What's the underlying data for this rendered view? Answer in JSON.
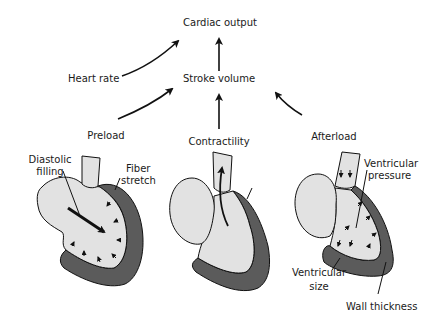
{
  "diagram": {
    "title": "Cardiac output",
    "nodes": {
      "cardiac_output": "Cardiac output",
      "heart_rate": "Heart rate",
      "stroke_volume": "Stroke volume",
      "preload": "Preload",
      "contractility": "Contractility",
      "afterload": "Afterload"
    },
    "edges": [
      {
        "from": "Heart rate",
        "to": "Cardiac output"
      },
      {
        "from": "Stroke volume",
        "to": "Cardiac output"
      },
      {
        "from": "Preload",
        "to": "Stroke volume"
      },
      {
        "from": "Contractility",
        "to": "Stroke volume"
      },
      {
        "from": "Afterload",
        "to": "Stroke volume"
      }
    ],
    "annotations": {
      "diastolic_filling_1": "Diastolic",
      "diastolic_filling_2": "filling",
      "fiber_stretch_1": "Fiber",
      "fiber_stretch_2": "stretch",
      "ventricular_pressure_1": "Ventricular",
      "ventricular_pressure_2": "pressure",
      "ventricular_size_1": "Ventricular",
      "ventricular_size_2": "size",
      "wall_thickness": "Wall thickness"
    },
    "colors": {
      "chamber_fill": "#e2e2e2",
      "wall_fill": "#5b5b5b",
      "stroke": "#111111",
      "text": "#1a1a1a"
    }
  }
}
